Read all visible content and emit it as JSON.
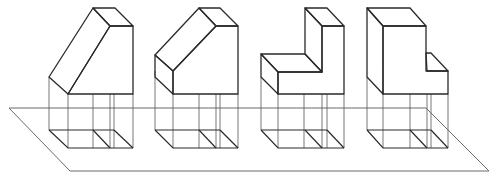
{
  "figure": {
    "shapes": [
      {
        "id": 1,
        "name": "sloped-block-full"
      },
      {
        "id": 2,
        "name": "sloped-block-chamfer"
      },
      {
        "id": 3,
        "name": "l-block-left-step"
      },
      {
        "id": 4,
        "name": "l-block-right-step"
      }
    ],
    "colors": {
      "line": "#2a2a2a",
      "projection": "#555555",
      "plane": "#6b6b6b",
      "background": "#ffffff"
    }
  }
}
